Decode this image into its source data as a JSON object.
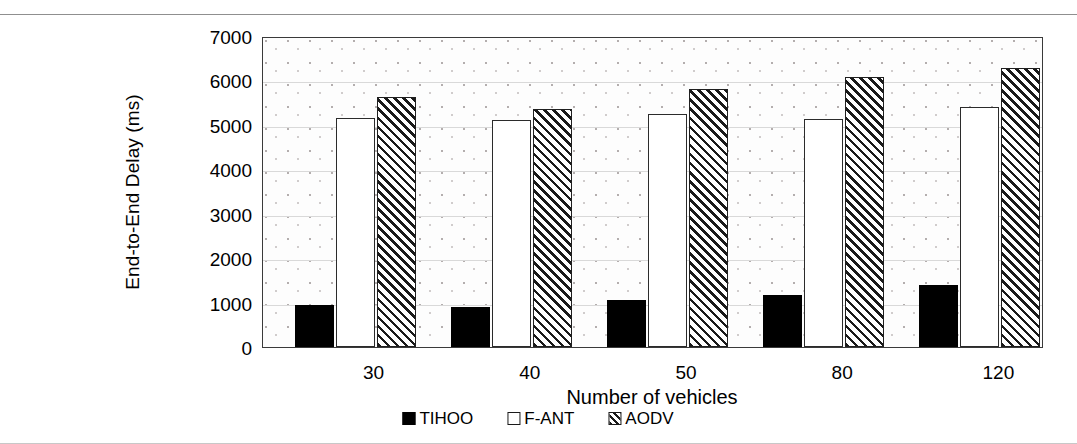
{
  "chart_data": {
    "type": "bar",
    "title": "",
    "xlabel": "Number of vehicles",
    "ylabel": "End-to-End Delay (ms)",
    "categories": [
      "30",
      "40",
      "50",
      "80",
      "120"
    ],
    "series": [
      {
        "name": "TIHOO",
        "values": [
          950,
          900,
          1050,
          1180,
          1400
        ],
        "fill": "solid-black",
        "color": "#000000"
      },
      {
        "name": "F-ANT",
        "values": [
          5160,
          5120,
          5240,
          5140,
          5400
        ],
        "fill": "hollow-white",
        "color": "#ffffff"
      },
      {
        "name": "AODV",
        "values": [
          5630,
          5350,
          5800,
          6070,
          6290
        ],
        "fill": "diagonal-hatch",
        "color": "#1a1a1a"
      }
    ],
    "ylim": [
      0,
      7000
    ],
    "ytick_step": 1000,
    "yticks": [
      "0",
      "1000",
      "2000",
      "3000",
      "4000",
      "5000",
      "6000",
      "7000"
    ],
    "grid": true,
    "legend_position": "bottom"
  },
  "legend": {
    "items": [
      {
        "label": "TIHOO"
      },
      {
        "label": "F-ANT"
      },
      {
        "label": "AODV"
      }
    ]
  }
}
